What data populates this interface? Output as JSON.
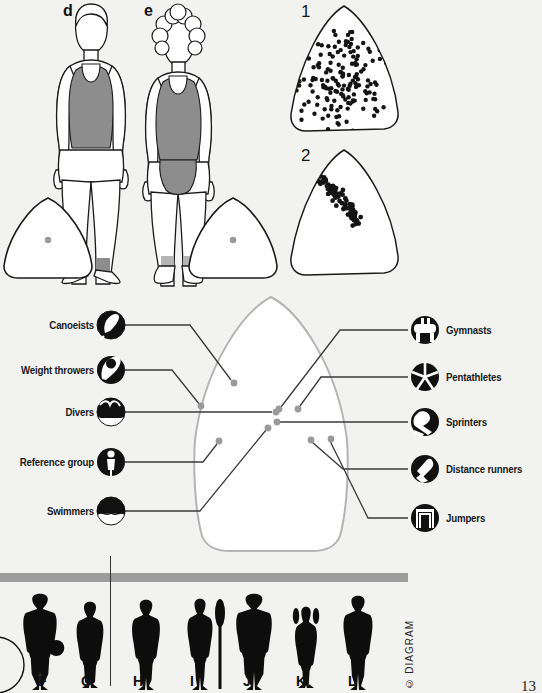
{
  "page": {
    "background_color": "#f2f2f1",
    "page_number": "13",
    "copyright": "© DIAGRAM"
  },
  "top_panels": {
    "figure_d": {
      "letter": "d",
      "caption": "",
      "somatotype_dot_color": "#9a9a9a"
    },
    "figure_e": {
      "letter": "e",
      "caption": "",
      "somatotype_dot_color": "#9a9a9a"
    },
    "scatter_1": {
      "number": "1",
      "dot_color": "#141414",
      "dot_count": 168
    },
    "scatter_2": {
      "number": "2",
      "dot_color": "#141414",
      "dot_count": 78
    }
  },
  "somatochart": {
    "outline_color": "#b4b4b4",
    "leader_color": "#3a3a3a",
    "point_color": "#9a9a9a",
    "left_labels": [
      {
        "label": "Canoeists",
        "icon": "canoe-paddle-icon",
        "point": [
          301,
          407
        ]
      },
      {
        "label": "Weight throwers",
        "icon": "discus-throw-icon",
        "point": [
          258,
          418
        ]
      },
      {
        "label": "Divers",
        "icon": "diver-splash-icon",
        "point": [
          274,
          421
        ]
      },
      {
        "label": "Reference group",
        "icon": "person-standing-icon",
        "point": [
          281,
          410
        ]
      },
      {
        "label": "Swimmers",
        "icon": "swimmer-water-icon",
        "point": [
          266,
          431
        ]
      }
    ],
    "right_labels": [
      {
        "label": "Gymnasts",
        "icon": "pommel-horse-icon",
        "point": [
          282,
          406
        ]
      },
      {
        "label": "Pentathletes",
        "icon": "five-segment-icon",
        "point": [
          299,
          409
        ]
      },
      {
        "label": "Sprinters",
        "icon": "sprinter-shoe-icon",
        "point": [
          285,
          421
        ]
      },
      {
        "label": "Distance runners",
        "icon": "running-shoe-icon",
        "point": [
          312,
          440
        ]
      },
      {
        "label": "Jumpers",
        "icon": "high-jump-bar-icon",
        "point": [
          330,
          438
        ]
      }
    ]
  },
  "bottom_strip": {
    "bar_color": "#9c9c9c",
    "silhouette_color": "#0d0d0d",
    "figures": [
      {
        "letter": "F"
      },
      {
        "letter": "G"
      },
      {
        "letter": "H"
      },
      {
        "letter": "I"
      },
      {
        "letter": "J"
      },
      {
        "letter": "K"
      },
      {
        "letter": "L"
      }
    ]
  }
}
